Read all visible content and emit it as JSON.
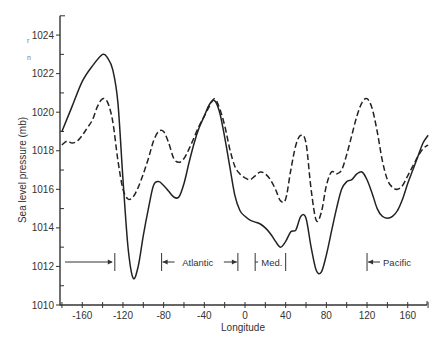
{
  "chart_data": {
    "type": "line",
    "title": "",
    "xlabel": "Longitude",
    "ylabel": "Sea level pressure (mb)",
    "xlim": [
      -180,
      180
    ],
    "ylim": [
      1010,
      1025
    ],
    "grid": false,
    "x_ticks": [
      -160,
      -120,
      -80,
      -40,
      0,
      40,
      80,
      120,
      160
    ],
    "y_ticks": [
      1010,
      1012,
      1014,
      1016,
      1018,
      1020,
      1022,
      1024
    ],
    "series": [
      {
        "name": "solid",
        "style": "solid",
        "x": [
          -180,
          -170,
          -160,
          -150,
          -140,
          -135,
          -130,
          -125,
          -120,
          -115,
          -110,
          -105,
          -100,
          -95,
          -90,
          -85,
          -80,
          -75,
          -70,
          -65,
          -60,
          -55,
          -50,
          -45,
          -40,
          -35,
          -30,
          -25,
          -20,
          -15,
          -10,
          -5,
          0,
          5,
          10,
          15,
          20,
          25,
          30,
          35,
          40,
          45,
          50,
          55,
          60,
          65,
          70,
          75,
          80,
          85,
          90,
          95,
          100,
          105,
          110,
          115,
          120,
          125,
          130,
          135,
          140,
          145,
          150,
          155,
          160,
          165,
          170,
          175,
          180
        ],
        "values": [
          1019.0,
          1020.3,
          1021.6,
          1022.4,
          1023.0,
          1022.8,
          1022.2,
          1020.5,
          1016.5,
          1013.0,
          1011.4,
          1012.0,
          1013.6,
          1015.0,
          1016.2,
          1016.4,
          1016.2,
          1015.9,
          1015.6,
          1015.6,
          1016.3,
          1017.4,
          1018.4,
          1019.2,
          1019.8,
          1020.4,
          1020.6,
          1020.0,
          1018.7,
          1017.2,
          1015.7,
          1014.9,
          1014.6,
          1014.4,
          1014.3,
          1014.2,
          1014.0,
          1013.7,
          1013.3,
          1013.0,
          1013.3,
          1013.8,
          1013.9,
          1014.6,
          1014.5,
          1013.0,
          1011.8,
          1011.7,
          1012.6,
          1013.8,
          1015.0,
          1016.0,
          1016.4,
          1016.5,
          1016.8,
          1016.9,
          1016.5,
          1015.8,
          1015.0,
          1014.6,
          1014.5,
          1014.6,
          1014.9,
          1015.5,
          1016.3,
          1017.0,
          1017.7,
          1018.4,
          1018.8
        ]
      },
      {
        "name": "dashed",
        "style": "dashed",
        "x": [
          -180,
          -175,
          -170,
          -165,
          -160,
          -155,
          -150,
          -145,
          -140,
          -135,
          -130,
          -125,
          -120,
          -115,
          -110,
          -105,
          -100,
          -95,
          -90,
          -85,
          -80,
          -75,
          -70,
          -65,
          -60,
          -55,
          -50,
          -45,
          -40,
          -35,
          -30,
          -25,
          -20,
          -15,
          -10,
          -5,
          0,
          5,
          10,
          15,
          20,
          25,
          30,
          35,
          40,
          45,
          50,
          55,
          60,
          65,
          70,
          75,
          80,
          85,
          90,
          95,
          100,
          105,
          110,
          115,
          120,
          125,
          130,
          135,
          140,
          145,
          150,
          155,
          160,
          165,
          170,
          175,
          180
        ],
        "values": [
          1018.3,
          1018.5,
          1018.4,
          1018.5,
          1018.8,
          1019.2,
          1019.6,
          1020.3,
          1020.7,
          1020.5,
          1019.5,
          1017.5,
          1016.0,
          1015.5,
          1015.6,
          1016.1,
          1016.8,
          1017.6,
          1018.5,
          1019.0,
          1019.0,
          1018.4,
          1017.6,
          1017.4,
          1017.6,
          1018.1,
          1018.7,
          1019.3,
          1019.8,
          1020.3,
          1020.7,
          1020.2,
          1019.3,
          1018.1,
          1017.2,
          1016.8,
          1016.6,
          1016.5,
          1016.7,
          1016.9,
          1016.8,
          1016.5,
          1016.0,
          1015.4,
          1015.5,
          1017.0,
          1018.3,
          1018.8,
          1018.4,
          1016.0,
          1014.4,
          1014.8,
          1016.2,
          1016.9,
          1016.8,
          1017.0,
          1017.8,
          1018.8,
          1019.8,
          1020.5,
          1020.7,
          1020.2,
          1019.0,
          1017.5,
          1016.5,
          1016.1,
          1016.0,
          1016.2,
          1016.7,
          1017.2,
          1017.7,
          1018.1,
          1018.3
        ]
      }
    ],
    "annotations": [
      {
        "type": "bracket-arrow",
        "label": "",
        "x_from": -180,
        "x_to": -128,
        "y": 1012.3,
        "arrow": "right-end"
      },
      {
        "type": "bracket-arrow",
        "label": "Atlantic",
        "x_from": -82,
        "x_to": -7,
        "y": 1012.3,
        "arrow": "both-inward"
      },
      {
        "type": "bracket",
        "label": "Med.",
        "x_from": 10,
        "x_to": 40,
        "y": 1012.3
      },
      {
        "type": "bracket-arrow",
        "label": "Pacific",
        "x_from": 120,
        "x_to": 180,
        "y": 1012.3,
        "arrow": "left-start"
      }
    ]
  },
  "labels": {
    "y_axis_title": "Sea level pressure (mb)",
    "x_axis_title": "Longitude",
    "atlantic": "Atlantic",
    "med": "Med.",
    "pacific": "Pacific",
    "margin_fragment_1": "r",
    "margin_fragment_2": "n"
  }
}
